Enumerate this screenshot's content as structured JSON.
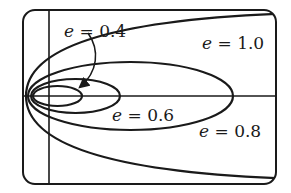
{
  "figure": {
    "curves": [
      {
        "id": "e04",
        "eccentricity": 0.4,
        "type": "ellipse",
        "label": "0.4"
      },
      {
        "id": "e06",
        "eccentricity": 0.6,
        "type": "ellipse",
        "label": "0.6"
      },
      {
        "id": "e08",
        "eccentricity": 0.8,
        "type": "ellipse",
        "label": "0.8"
      },
      {
        "id": "e10",
        "eccentricity": 1.0,
        "type": "parabola",
        "label": "1.0"
      }
    ],
    "labels": {
      "var": "e",
      "eq": " = ",
      "e04": "0.4",
      "e06": "0.6",
      "e08": "0.8",
      "e10": "1.0"
    },
    "colors": {
      "stroke": "#1a1a1a",
      "background": "#ffffff"
    }
  }
}
